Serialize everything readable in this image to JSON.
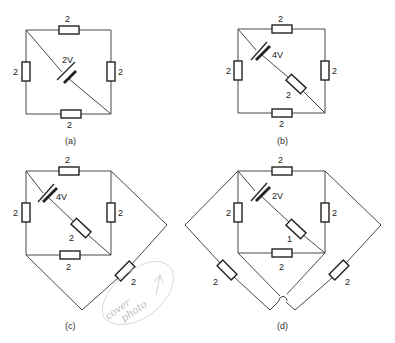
{
  "figure": {
    "diagrams": [
      {
        "id": "a",
        "caption": "(a)",
        "resistors": {
          "top": "2",
          "bottom": "2",
          "left": "2",
          "right": "2"
        },
        "diagonal": {
          "battery": "2V"
        }
      },
      {
        "id": "b",
        "caption": "(b)",
        "resistors": {
          "top": "2",
          "bottom": "2",
          "left": "2",
          "right": "2"
        },
        "diagonal": {
          "battery": "4V",
          "resistor": "2"
        }
      },
      {
        "id": "c",
        "caption": "(c)",
        "resistors": {
          "top": "2",
          "bottom": "2",
          "left": "2",
          "right": "2"
        },
        "diagonal": {
          "battery": "4V",
          "resistor": "2"
        },
        "external": {
          "resistor": "2"
        }
      },
      {
        "id": "d",
        "caption": "(d)",
        "resistors": {
          "top": "2",
          "bottom": "2",
          "left": "2",
          "right": "2"
        },
        "diagonal": {
          "battery": "2V",
          "resistor": "1"
        },
        "external": {
          "left_resistor": "2",
          "right_resistor": "2"
        }
      }
    ],
    "handwritten_note": {
      "line1": "cover",
      "line2": "photo"
    }
  }
}
